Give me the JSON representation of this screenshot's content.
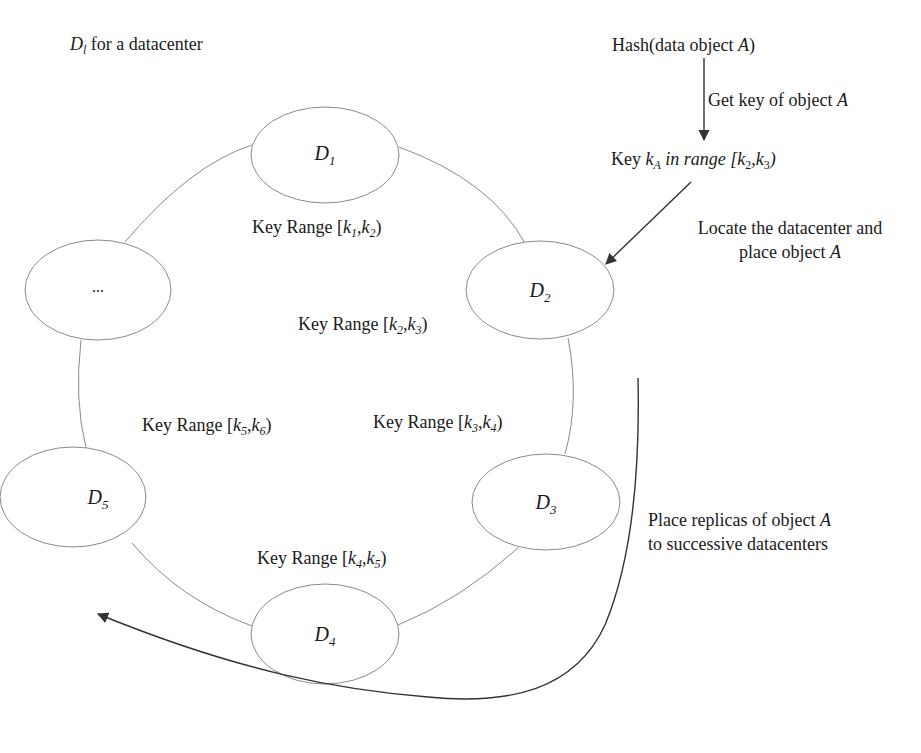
{
  "legend": {
    "symbol": "D",
    "symbol_sub": "l",
    "text": " for a datacenter"
  },
  "nodes": [
    {
      "id": "D1",
      "symbol": "D",
      "sub": "1",
      "cx": 325,
      "cy": 155
    },
    {
      "id": "ellipsis",
      "symbol": "...",
      "sub": "",
      "cx": 98,
      "cy": 290
    },
    {
      "id": "D2",
      "symbol": "D",
      "sub": "2",
      "cx": 540,
      "cy": 290
    },
    {
      "id": "D5",
      "symbol": "D",
      "sub": "5",
      "cx": 73,
      "cy": 497
    },
    {
      "id": "D3",
      "symbol": "D",
      "sub": "3",
      "cx": 546,
      "cy": 502
    },
    {
      "id": "D4",
      "symbol": "D",
      "sub": "4",
      "cx": 325,
      "cy": 634
    }
  ],
  "key_ranges": [
    {
      "prefix": "Key Range [",
      "k_from": "k",
      "from_sub": "1",
      "sep": ",",
      "k_to": "k",
      "to_sub": "2",
      "suffix": ")"
    },
    {
      "prefix": "Key Range [",
      "k_from": "k",
      "from_sub": "2",
      "sep": ",",
      "k_to": "k",
      "to_sub": "3",
      "suffix": ")"
    },
    {
      "prefix": "Key Range [",
      "k_from": "k",
      "from_sub": "3",
      "sep": ",",
      "k_to": "k",
      "to_sub": "4",
      "suffix": ")"
    },
    {
      "prefix": "Key Range [",
      "k_from": "k",
      "from_sub": "4",
      "sep": ",",
      "k_to": "k",
      "to_sub": "5",
      "suffix": ")"
    },
    {
      "prefix": "Key Range [",
      "k_from": "k",
      "from_sub": "5",
      "sep": ",",
      "k_to": "k",
      "to_sub": "6",
      "suffix": ")"
    }
  ],
  "flow": {
    "hash_prefix": "Hash(data object ",
    "hash_obj": "A",
    "hash_suffix": ")",
    "get_key_prefix": "Get key of object ",
    "get_key_obj": "A",
    "key_prefix": "Key ",
    "key_var": "k",
    "key_var_sub": "A",
    "key_range_text": " in range [k",
    "key_range_sub1": "2",
    "key_range_sep": ",k",
    "key_range_sub2": "3",
    "key_range_suffix": ")",
    "locate_line1": "Locate the datacenter and",
    "locate_line2_prefix": "place object ",
    "locate_line2_obj": "A",
    "replica_line1_prefix": "Place replicas of object ",
    "replica_line1_obj": "A",
    "replica_line2": "to successive datacenters"
  },
  "colors": {
    "ring_stroke": "#8a8a8a",
    "arrow_stroke": "#333333",
    "text": "#1a1a1a"
  }
}
